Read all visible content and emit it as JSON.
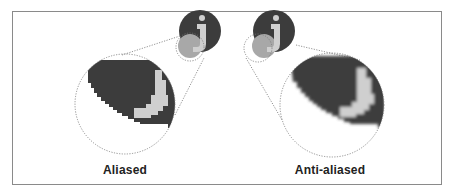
{
  "figure": {
    "left_panel": {
      "label": "Aliased",
      "icon": "info-j-icon"
    },
    "right_panel": {
      "label": "Anti-aliased",
      "icon": "info-j-icon"
    }
  },
  "colors": {
    "dark": "#3c3c3c",
    "light_letter": "#cfcfcf",
    "mid_gray": "#a8a8a8",
    "frame": "#8a8a8a",
    "dotted": "#777777"
  }
}
